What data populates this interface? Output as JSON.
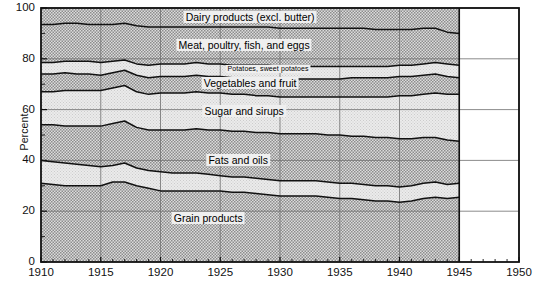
{
  "chart_data": {
    "type": "area",
    "title": "",
    "xlabel": "",
    "ylabel": "Percent",
    "xlim": [
      1910,
      1950
    ],
    "ylim": [
      0,
      100
    ],
    "grid": true,
    "legend_position": "inline-labels",
    "x_ticks": [
      "1910",
      "1915",
      "1920",
      "1925",
      "1930",
      "1935",
      "1940",
      "1945",
      "1950"
    ],
    "y_ticks": [
      "0",
      "20",
      "40",
      "60",
      "80",
      "100"
    ],
    "x_minor_tick_interval": 1,
    "y_minor_tick_interval": 10,
    "data_end_year": 1945,
    "x": [
      1910,
      1911,
      1912,
      1913,
      1914,
      1915,
      1916,
      1917,
      1918,
      1919,
      1920,
      1921,
      1922,
      1923,
      1924,
      1925,
      1926,
      1927,
      1928,
      1929,
      1930,
      1931,
      1932,
      1933,
      1934,
      1935,
      1936,
      1937,
      1938,
      1939,
      1940,
      1941,
      1942,
      1943,
      1944,
      1945
    ],
    "stacking": "bottom-to-top",
    "series": [
      {
        "name": "Grain products",
        "label": "Grain products",
        "shading": "dark-hatch",
        "cumulative_top": [
          31,
          30.5,
          30,
          30,
          30,
          30,
          31.5,
          31.5,
          30,
          29,
          28,
          28,
          28,
          28,
          28,
          28,
          27.5,
          27.5,
          27,
          26.5,
          26,
          26,
          26,
          26,
          25.5,
          25,
          25,
          24.5,
          24,
          24,
          23.5,
          24,
          25,
          25.5,
          25,
          25.5
        ]
      },
      {
        "name": "Fats and oils",
        "label": "Fats and oils",
        "shading": "light",
        "cumulative_top": [
          40,
          39.5,
          39,
          38.5,
          38,
          37.5,
          38,
          39,
          37,
          36,
          35.5,
          35,
          35,
          35,
          34.5,
          34,
          33.5,
          33.5,
          33,
          32.5,
          32,
          32,
          32,
          32,
          31.5,
          31,
          31,
          30.5,
          30,
          30,
          29.5,
          30,
          31,
          31.5,
          30.5,
          31
        ]
      },
      {
        "name": "Sugar and sirups",
        "label": "Sugar and sirups",
        "shading": "dark-hatch",
        "cumulative_top": [
          54,
          54,
          53.5,
          53.5,
          53.5,
          53.5,
          54.5,
          55.5,
          53,
          52,
          52,
          52,
          52,
          52.5,
          52,
          52,
          51.5,
          51.5,
          51,
          51,
          50.5,
          50.5,
          50.5,
          50.5,
          50,
          50,
          49.5,
          49.5,
          49,
          49,
          48.5,
          48.5,
          49,
          49,
          48,
          47.5
        ]
      },
      {
        "name": "Vegetables and fruit",
        "label": "Vegetables and fruit",
        "shading": "light",
        "cumulative_top": [
          67,
          67,
          67.5,
          67.5,
          67.5,
          67.5,
          68.5,
          69.5,
          67,
          66,
          66.5,
          66.5,
          66.5,
          67,
          66.5,
          66.5,
          66,
          66,
          65.5,
          65.5,
          65,
          65,
          65,
          65,
          65,
          65,
          65,
          65,
          65,
          65,
          65.5,
          65.5,
          66,
          66.5,
          66,
          66
        ]
      },
      {
        "name": "Potatoes, sweet potatoes",
        "label": "Potatoes, sweet potatoes",
        "shading": "dark-hatch",
        "cumulative_top": [
          74,
          74,
          74.5,
          74,
          74,
          73.5,
          74.5,
          75.5,
          73.5,
          72.5,
          73,
          73,
          73,
          73.5,
          73,
          73,
          72.5,
          72.5,
          72.5,
          72.5,
          72,
          72,
          72,
          72,
          72,
          72,
          72.5,
          72.5,
          72.5,
          72.5,
          73,
          73,
          73.5,
          74,
          73,
          72.5
        ]
      },
      {
        "name": "Meat, poultry, fish, and eggs",
        "label": "Meat, poultry, fish, and eggs",
        "shading": "light",
        "cumulative_top": [
          78.5,
          78.5,
          79,
          79,
          79,
          78.5,
          79,
          79.5,
          78,
          77.5,
          78,
          78,
          78,
          78.5,
          78,
          78,
          77.5,
          77.5,
          77.5,
          77.5,
          77,
          77,
          77,
          77,
          77,
          77,
          77,
          77,
          77,
          77,
          77.5,
          77.5,
          78,
          78.5,
          78,
          77.5
        ]
      },
      {
        "name": "Dairy products (excl. butter)",
        "label": "Dairy products (excl. butter)",
        "shading": "dark-hatch",
        "cumulative_top": [
          93.5,
          93.5,
          94,
          94,
          93.5,
          93.5,
          93.5,
          94,
          93,
          92.5,
          92.5,
          92.5,
          92.5,
          92.5,
          92.5,
          92.5,
          92.5,
          92.5,
          92.5,
          92.5,
          92,
          92,
          92,
          92,
          92,
          92,
          92,
          92,
          91.5,
          91.5,
          91.5,
          91.5,
          92,
          92,
          90.5,
          90
        ]
      }
    ],
    "series_label_positions": [
      {
        "name": "Dairy products (excl. butter)",
        "x_year": 1927.5,
        "y_pct": 96.5,
        "size": "big"
      },
      {
        "name": "Meat, poultry, fish, and eggs",
        "x_year": 1927.0,
        "y_pct": 85.5,
        "size": "big"
      },
      {
        "name": "Potatoes, sweet potatoes",
        "x_year": 1929.0,
        "y_pct": 76.0,
        "size": "small"
      },
      {
        "name": "Vegetables and fruit",
        "x_year": 1927.5,
        "y_pct": 70.5,
        "size": "big"
      },
      {
        "name": "Sugar and sirups",
        "x_year": 1927.0,
        "y_pct": 59.5,
        "size": "big"
      },
      {
        "name": "Fats and oils",
        "x_year": 1926.5,
        "y_pct": 40.0,
        "size": "big"
      },
      {
        "name": "Grain products",
        "x_year": 1924.0,
        "y_pct": 17.5,
        "size": "big"
      }
    ]
  }
}
